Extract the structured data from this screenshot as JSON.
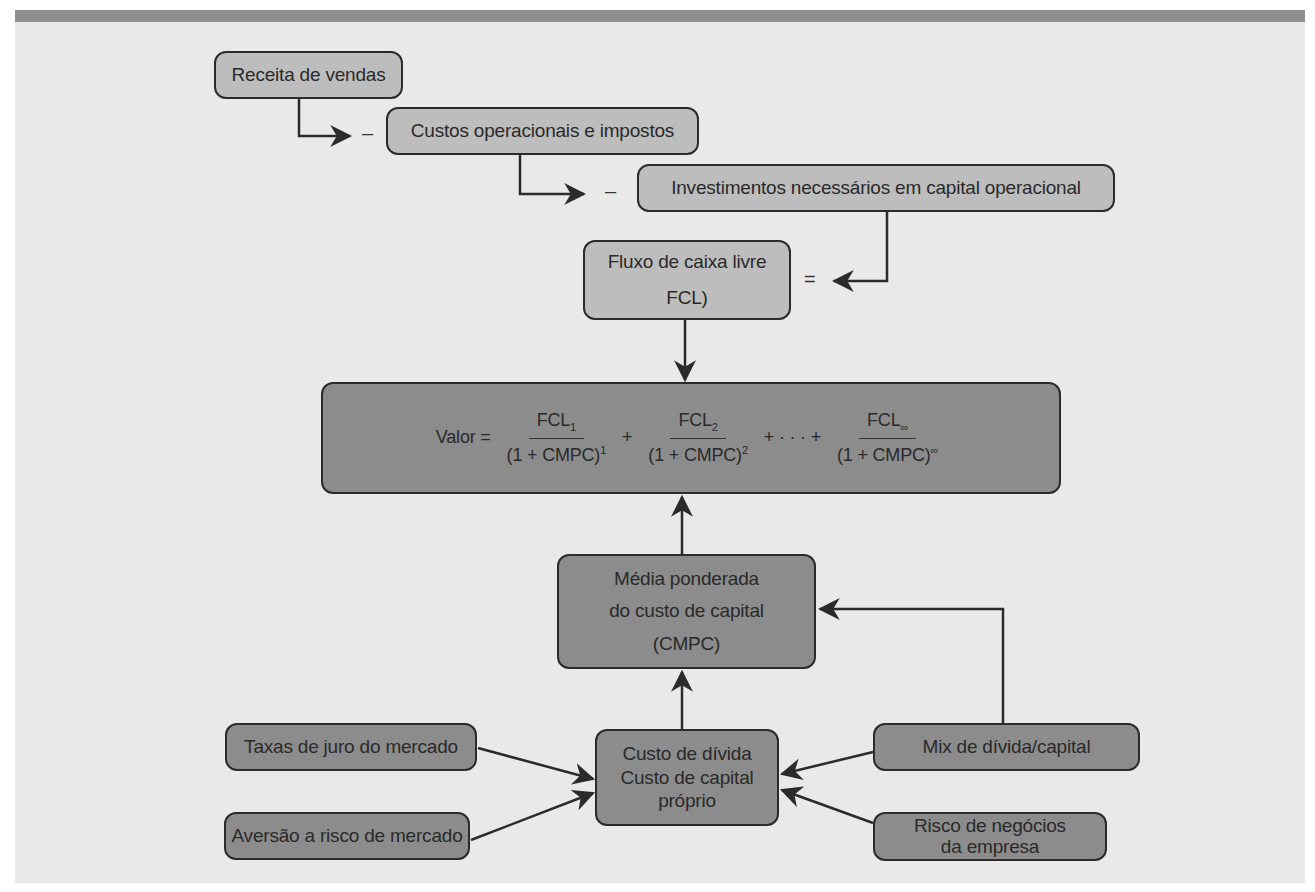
{
  "diagram": {
    "title": "",
    "top_section": {
      "sales_revenue": "Receita de vendas",
      "operating_costs": "Custos operacionais e impostos",
      "required_investments": "Investimentos necessários em capital operacional",
      "minus_1": "–",
      "minus_2": "–",
      "equals": "=",
      "free_cash_flow": {
        "line1": "Fluxo de caixa livre",
        "line2": "FCL)"
      }
    },
    "value_formula": {
      "lhs": "Valor =",
      "terms": [
        {
          "num": "FCL",
          "num_sub": "1",
          "den": "(1 + CMPC)",
          "den_sup": "1"
        },
        {
          "num": "FCL",
          "num_sub": "2",
          "den": "(1 + CMPC)",
          "den_sup": "2"
        },
        {
          "num": "FCL",
          "num_sub": "∞",
          "den": "(1 + CMPC)",
          "den_sup": "∞"
        }
      ],
      "plus": "+",
      "ellipsis": "+ · · · +"
    },
    "wacc": {
      "line1": "Média ponderada",
      "line2": "do custo de capital",
      "line3": "(CMPC)"
    },
    "cost_of_capital": {
      "line1": "Custo de dívida",
      "line2": "Custo de capital",
      "line3": "próprio"
    },
    "inputs": {
      "market_interest_rates": "Taxas de juro do mercado",
      "market_risk_aversion": "Aversão a risco de mercado",
      "debt_equity_mix": "Mix de dívida/capital",
      "business_risk": {
        "line1": "Risco de negócios",
        "line2": "da empresa"
      }
    },
    "colors": {
      "top_bar": "#8f8f8f",
      "background": "#e9e9e9",
      "light_box": "#bdbdbd",
      "dark_box": "#8c8c8c",
      "stroke": "#2b2b2b"
    }
  }
}
